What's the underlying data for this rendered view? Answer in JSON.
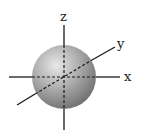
{
  "diagram": {
    "axes": {
      "x_label": "x",
      "y_label": "y",
      "z_label": "z"
    },
    "colors": {
      "sphere_light": "#e4e4e4",
      "sphere_mid": "#a6a6a6",
      "sphere_dark": "#6e6e6e",
      "axis": "#1a1a1a"
    }
  }
}
